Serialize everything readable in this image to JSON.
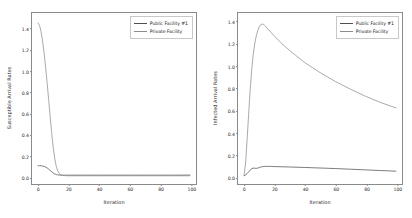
{
  "figure": {
    "background": "#ffffff",
    "panels": [
      "left",
      "right"
    ]
  },
  "legend": {
    "entries": [
      {
        "label": "Public Facility #1",
        "color": "#4f4f4f"
      },
      {
        "label": "Private Facility",
        "color": "#8c8c8c"
      }
    ]
  },
  "chart_data": [
    {
      "type": "line",
      "title": "",
      "xlabel": "Iteration",
      "ylabel": "Susceptible Arrival Rates",
      "xlim": [
        -4,
        104
      ],
      "ylim": [
        -0.075,
        1.55
      ],
      "xticks": [
        "0",
        "20",
        "40",
        "60",
        "80",
        "100"
      ],
      "xtick_values": [
        0,
        20,
        40,
        60,
        80,
        100
      ],
      "yticks": [
        "0.0",
        "0.2",
        "0.4",
        "0.6",
        "0.8",
        "1.0",
        "1.2",
        "1.4"
      ],
      "ytick_values": [
        0.0,
        0.2,
        0.4,
        0.6,
        0.8,
        1.0,
        1.2,
        1.4
      ],
      "grid": false,
      "legend_position": "upper right",
      "x": [
        0,
        1,
        2,
        3,
        4,
        5,
        6,
        7,
        8,
        9,
        10,
        11,
        12,
        13,
        14,
        15,
        16,
        18,
        20,
        25,
        30,
        40,
        50,
        60,
        70,
        80,
        90,
        100
      ],
      "series": [
        {
          "name": "Public Facility #1",
          "color": "#4f4f4f",
          "values": [
            0.098,
            0.099,
            0.098,
            0.096,
            0.092,
            0.086,
            0.077,
            0.066,
            0.054,
            0.041,
            0.029,
            0.021,
            0.015,
            0.012,
            0.01,
            0.009,
            0.009,
            0.009,
            0.009,
            0.009,
            0.009,
            0.009,
            0.009,
            0.009,
            0.009,
            0.009,
            0.009,
            0.01
          ]
        },
        {
          "name": "Private Facility",
          "color": "#8c8c8c",
          "values": [
            1.455,
            1.43,
            1.37,
            1.28,
            1.165,
            1.03,
            0.88,
            0.72,
            0.56,
            0.405,
            0.27,
            0.165,
            0.092,
            0.048,
            0.024,
            0.012,
            0.007,
            0.004,
            0.003,
            0.003,
            0.003,
            0.003,
            0.003,
            0.003,
            0.003,
            0.003,
            0.003,
            0.003
          ]
        }
      ]
    },
    {
      "type": "line",
      "title": "",
      "xlabel": "Iteration",
      "ylabel": "Infected Arrival Rates",
      "xlim": [
        -4,
        104
      ],
      "ylim": [
        -0.07,
        1.48
      ],
      "xticks": [
        "0",
        "20",
        "40",
        "60",
        "80",
        "100"
      ],
      "xtick_values": [
        0,
        20,
        40,
        60,
        80,
        100
      ],
      "yticks": [
        "0.0",
        "0.2",
        "0.4",
        "0.6",
        "0.8",
        "1.0",
        "1.2",
        "1.4"
      ],
      "ytick_values": [
        0.0,
        0.2,
        0.4,
        0.6,
        0.8,
        1.0,
        1.2,
        1.4
      ],
      "grid": false,
      "legend_position": "upper right",
      "x": [
        0,
        1,
        2,
        3,
        4,
        5,
        6,
        7,
        8,
        9,
        10,
        11,
        12,
        13,
        14,
        16,
        18,
        20,
        25,
        30,
        40,
        50,
        60,
        70,
        80,
        90,
        100
      ],
      "series": [
        {
          "name": "Public Facility #1",
          "color": "#4f4f4f",
          "values": [
            0.005,
            0.012,
            0.024,
            0.04,
            0.056,
            0.068,
            0.074,
            0.073,
            0.072,
            0.074,
            0.079,
            0.084,
            0.087,
            0.089,
            0.09,
            0.09,
            0.089,
            0.088,
            0.086,
            0.084,
            0.08,
            0.075,
            0.07,
            0.064,
            0.058,
            0.052,
            0.046
          ]
        },
        {
          "name": "Private Facility",
          "color": "#8c8c8c",
          "values": [
            0.01,
            0.12,
            0.33,
            0.56,
            0.78,
            0.96,
            1.1,
            1.2,
            1.27,
            1.32,
            1.355,
            1.375,
            1.38,
            1.375,
            1.362,
            1.33,
            1.3,
            1.27,
            1.2,
            1.14,
            1.03,
            0.94,
            0.86,
            0.79,
            0.725,
            0.668,
            0.62
          ]
        }
      ]
    }
  ]
}
